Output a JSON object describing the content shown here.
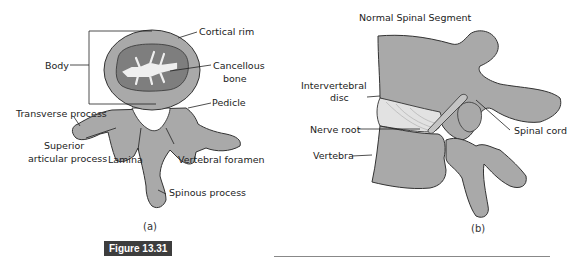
{
  "panel_a": {
    "labels": {
      "cortical_rim": "Cortical rim",
      "body": "Body",
      "cancellous_bone_line1": "Cancellous",
      "cancellous_bone_line2": "bone",
      "pedicle": "Pedicle",
      "transverse_process": "Transverse process",
      "superior_articular_line1": "Superior",
      "superior_articular_line2": "articular process",
      "lamina": "Lamina",
      "vertebral_foramen": "Vertebral foramen",
      "spinous_process": "Spinous process"
    },
    "caption": "(a)"
  },
  "panel_b": {
    "title": "Normal Spinal Segment",
    "labels": {
      "intervertebral_disc_line1": "Intervertebral",
      "intervertebral_disc_line2": "disc",
      "nerve_root": "Nerve root",
      "spinal_cord": "Spinal cord",
      "vertebra": "Vertebra"
    },
    "caption": "(b)"
  },
  "figure": {
    "tag": "Figure 13.31"
  },
  "colors": {
    "bone": "#a9a9a9",
    "bone_dark": "#7e7e7e",
    "cancellous": "#efefef",
    "disc": "#e2e2e2",
    "outline": "#333333",
    "tag_bg": "#3d3d3d"
  }
}
